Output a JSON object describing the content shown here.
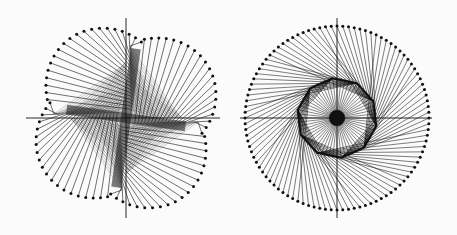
{
  "figure": {
    "background": "#fbfbfb",
    "ink": "#111111",
    "panels": [
      {
        "name": "pinwheel-figure",
        "center": [
          126,
          118
        ],
        "axes": {
          "x": [
            26,
            220
          ],
          "y": [
            18,
            218
          ]
        },
        "lobes": 4,
        "lobe_radius": 58,
        "spokes_per_lobe": 20,
        "dot_radius": 1.5
      },
      {
        "name": "rosette-figure",
        "center": [
          337,
          118
        ],
        "axes": {
          "x": [
            240,
            432
          ],
          "y": [
            18,
            218
          ]
        },
        "outer_radius": 92,
        "inner_radius": 40,
        "inner_polygon_sides": 10,
        "outer_dots": 100,
        "dot_radius": 1.5
      }
    ]
  }
}
